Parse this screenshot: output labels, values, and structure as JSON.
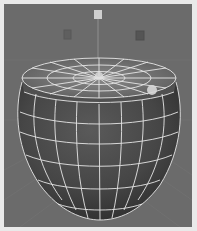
{
  "viewport": {
    "label": "3D perspective viewport",
    "background_color": "#6b6b6b",
    "grid_color": "#7a7a7a",
    "frame_color": "#e9e9e9"
  },
  "scene": {
    "object": {
      "name": "bowl-mesh",
      "shading": "smooth shaded with wireframe on shaded",
      "surface_color": "#4a4a4a",
      "wire_color": "#e6e6e6"
    },
    "lights": [
      {
        "name": "light-top",
        "x": 98,
        "y": 15
      },
      {
        "name": "light-left",
        "x": 67,
        "y": 34
      },
      {
        "name": "light-right",
        "x": 140,
        "y": 35
      }
    ],
    "highlight": {
      "x": 152,
      "y": 90
    }
  }
}
